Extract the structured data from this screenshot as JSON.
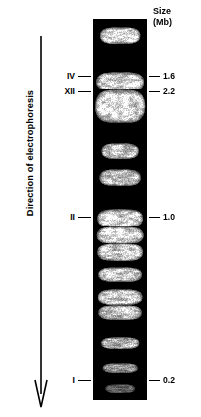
{
  "figure": {
    "type": "pulsed-field-gel-electrophoresis",
    "direction_label": "Direction of electrophoresis",
    "arrow_icon": "down-arrow-icon",
    "size_header": {
      "line1": "Size",
      "line2": "(Mb)"
    }
  },
  "chart_data": {
    "type": "table",
    "title": "Direction of electrophoresis",
    "xlabel": "",
    "ylabel": "Size (Mb)",
    "lane": {
      "label": "",
      "top_px": 19,
      "bottom_px": 400,
      "left_px": 93,
      "right_px": 147,
      "background": "#000000",
      "band_color": "#ffffff"
    },
    "chromosome_labels": [
      {
        "name": "IV",
        "y": 77,
        "size_mb": "1.6"
      },
      {
        "name": "XII",
        "y": 92,
        "size_mb": "2.2"
      },
      {
        "name": "II",
        "y": 218,
        "size_mb": "1.0"
      },
      {
        "name": "I",
        "y": 381,
        "size_mb": "0.2"
      }
    ],
    "size_markers": [
      {
        "value": "1.6",
        "y": 77
      },
      {
        "value": "2.2",
        "y": 92
      },
      {
        "value": "1.0",
        "y": 218
      },
      {
        "value": "0.2",
        "y": 381
      }
    ],
    "bands": [
      {
        "id": "band-1",
        "top": 8,
        "height": 17,
        "intensity": 1.0,
        "width_pct": 76,
        "seed": 11
      },
      {
        "id": "band-2",
        "top": 53,
        "height": 20,
        "intensity": 0.96,
        "width_pct": 90,
        "seed": 23
      },
      {
        "id": "band-3",
        "top": 70,
        "height": 34,
        "intensity": 1.0,
        "width_pct": 94,
        "seed": 37
      },
      {
        "id": "band-4",
        "top": 124,
        "height": 16,
        "intensity": 0.88,
        "width_pct": 70,
        "seed": 45
      },
      {
        "id": "band-5",
        "top": 150,
        "height": 17,
        "intensity": 0.88,
        "width_pct": 78,
        "seed": 57
      },
      {
        "id": "band-6",
        "top": 190,
        "height": 19,
        "intensity": 0.95,
        "width_pct": 86,
        "seed": 69
      },
      {
        "id": "band-7",
        "top": 207,
        "height": 18,
        "intensity": 0.97,
        "width_pct": 88,
        "seed": 75
      },
      {
        "id": "band-8",
        "top": 224,
        "height": 18,
        "intensity": 0.93,
        "width_pct": 86,
        "seed": 83
      },
      {
        "id": "band-9",
        "top": 248,
        "height": 15,
        "intensity": 0.9,
        "width_pct": 82,
        "seed": 91
      },
      {
        "id": "band-10",
        "top": 270,
        "height": 16,
        "intensity": 0.9,
        "width_pct": 84,
        "seed": 99
      },
      {
        "id": "band-11",
        "top": 286,
        "height": 15,
        "intensity": 0.86,
        "width_pct": 82,
        "seed": 107
      },
      {
        "id": "band-12",
        "top": 318,
        "height": 12,
        "intensity": 0.78,
        "width_pct": 72,
        "seed": 115
      },
      {
        "id": "band-13",
        "top": 344,
        "height": 10,
        "intensity": 0.62,
        "width_pct": 66,
        "seed": 123
      },
      {
        "id": "band-14",
        "top": 365,
        "height": 9,
        "intensity": 0.42,
        "width_pct": 56,
        "seed": 131
      },
      {
        "id": "band-15",
        "top": 386,
        "height": 5,
        "intensity": 0.22,
        "width_pct": 14,
        "seed": 139
      }
    ]
  }
}
